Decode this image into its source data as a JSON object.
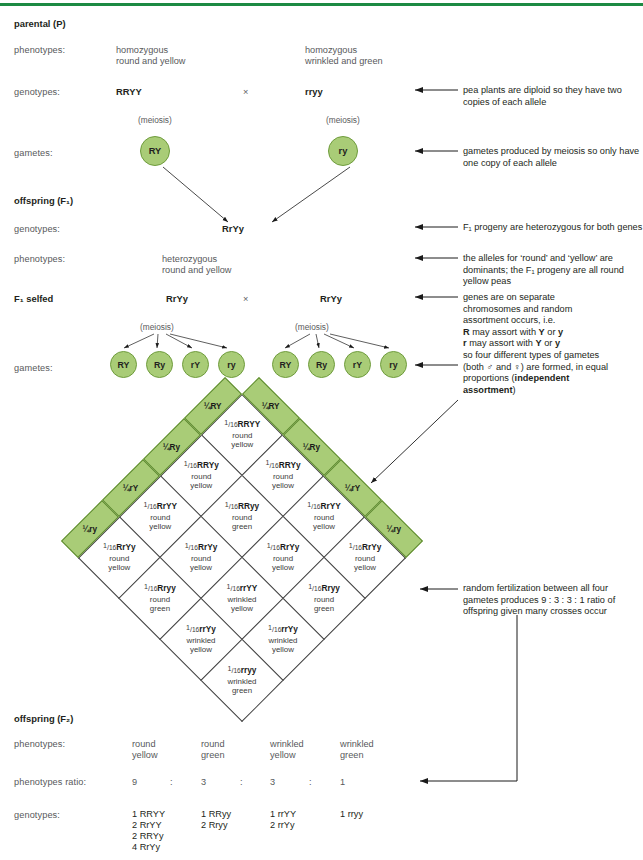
{
  "meta": {
    "accent_green": "#1d8a43",
    "cell_green": "#a9cc77",
    "cell_green_border": "#5d8a2f"
  },
  "topbar": {
    "name": "top-rule"
  },
  "sections": {
    "parental": {
      "title": "parental (P)"
    },
    "offspring_f1": {
      "title": "offspring (F₁)"
    },
    "f1_selfed": {
      "title": "F₁ selfed"
    },
    "offspring_f2": {
      "title": "offspring (F₂)"
    }
  },
  "row_labels": {
    "phenotypes": "phenotypes:",
    "genotypes": "genotypes:",
    "gametes": "gametes:",
    "phenotypes2": "phenotypes:",
    "genotypes2": "genotypes:",
    "phenotypes_ratio": "phenotypes ratio:",
    "genotypes3": "genotypes:",
    "phenotypes_f2": "phenotypes:"
  },
  "parental": {
    "phenotype_left_line1": "homozygous",
    "phenotype_left_line2": "round and yellow",
    "phenotype_right_line1": "homozygous",
    "phenotype_right_line2": "wrinkled and green",
    "genotype_left": "RRYY",
    "cross_symbol": "×",
    "genotype_right": "rryy",
    "meiosis_left": "(meiosis)",
    "meiosis_right": "(meiosis)",
    "gamete_left": "RY",
    "gamete_right": "ry"
  },
  "f1": {
    "genotype": "RrYy",
    "phenotype_line1": "heterozygous",
    "phenotype_line2": "round and yellow"
  },
  "f1_selfed": {
    "genotype_left": "RrYy",
    "cross_symbol": "×",
    "genotype_right": "RrYy",
    "meiosis_left": "(meiosis)",
    "meiosis_right": "(meiosis)",
    "gametes_left": [
      "RY",
      "Ry",
      "rY",
      "ry"
    ],
    "gametes_right": [
      "RY",
      "Ry",
      "rY",
      "ry"
    ]
  },
  "punnett": {
    "top_headers": [
      "¼RY",
      "¼Ry",
      "¼rY",
      "¼ry"
    ],
    "left_headers": [
      "¼RY",
      "¼Ry",
      "¼rY",
      "¼ry"
    ],
    "fraction_num": "1",
    "fraction_den": "16",
    "cells": [
      [
        {
          "genotype": "RRYY",
          "p1": "round",
          "p2": "yellow"
        },
        {
          "genotype": "RRYy",
          "p1": "round",
          "p2": "yellow"
        },
        {
          "genotype": "RrYY",
          "p1": "round",
          "p2": "yellow"
        },
        {
          "genotype": "RrYy",
          "p1": "round",
          "p2": "yellow"
        }
      ],
      [
        {
          "genotype": "RRYy",
          "p1": "round",
          "p2": "yellow"
        },
        {
          "genotype": "RRyy",
          "p1": "round",
          "p2": "green"
        },
        {
          "genotype": "RrYy",
          "p1": "round",
          "p2": "yellow"
        },
        {
          "genotype": "Rryy",
          "p1": "round",
          "p2": "green"
        }
      ],
      [
        {
          "genotype": "RrYY",
          "p1": "round",
          "p2": "yellow"
        },
        {
          "genotype": "RrYy",
          "p1": "round",
          "p2": "yellow"
        },
        {
          "genotype": "rrYY",
          "p1": "wrinkled",
          "p2": "yellow"
        },
        {
          "genotype": "rrYy",
          "p1": "wrinkled",
          "p2": "yellow"
        }
      ],
      [
        {
          "genotype": "RrYy",
          "p1": "round",
          "p2": "yellow"
        },
        {
          "genotype": "Rryy",
          "p1": "round",
          "p2": "green"
        },
        {
          "genotype": "rrYy",
          "p1": "wrinkled",
          "p2": "yellow"
        },
        {
          "genotype": "rryy",
          "p1": "wrinkled",
          "p2": "green"
        }
      ]
    ]
  },
  "f2": {
    "phenotypes": [
      {
        "line1": "round",
        "line2": "yellow"
      },
      {
        "line1": "round",
        "line2": "green"
      },
      {
        "line1": "wrinkled",
        "line2": "yellow"
      },
      {
        "line1": "wrinkled",
        "line2": "green"
      }
    ],
    "ratio": [
      "9",
      "3",
      "3",
      "1"
    ],
    "ratio_sep": ":",
    "genotypes": [
      [
        "1 RRYY",
        "2 RrYY",
        "2 RRYy",
        "4 RrYy"
      ],
      [
        "1 RRyy",
        "2 Rryy"
      ],
      [
        "1 rrYY",
        "2 rrYy"
      ],
      [
        "1 rryy"
      ]
    ]
  },
  "annotations": {
    "a1": "pea plants are diploid so they have two copies of each allele",
    "a2": "gametes produced by meiosis so only have one copy of each allele",
    "a3": "F₁ progeny are heterozygous for both genes",
    "a4": "the alleles for ‘round’ and ‘yellow’ are dominants; the F₁ progeny are all round yellow peas",
    "a5_l1": "genes are on separate",
    "a5_l2": "chromosomes and random",
    "a5_l3": "assortment occurs, i.e.",
    "a5_l4_a": "R",
    "a5_l4_b": " may assort with ",
    "a5_l4_c": "Y",
    "a5_l4_d": " or ",
    "a5_l4_e": "y",
    "a5_l5_a": "r",
    "a5_l5_b": " may assort with ",
    "a5_l5_c": "Y",
    "a5_l5_d": " or ",
    "a5_l5_e": "y",
    "a6_l1": "so four different types of gametes",
    "a6_l2": "(both ♂ and ♀) are formed, in equal",
    "a6_l3_a": "proportions (",
    "a6_l3_b": "independent",
    "a6_l4_b": "assortment",
    "a6_l4_c": ")",
    "a7": "random fertilization between all four gametes produces 9 : 3 : 3 : 1 ratio of offspring given many crosses occur"
  }
}
